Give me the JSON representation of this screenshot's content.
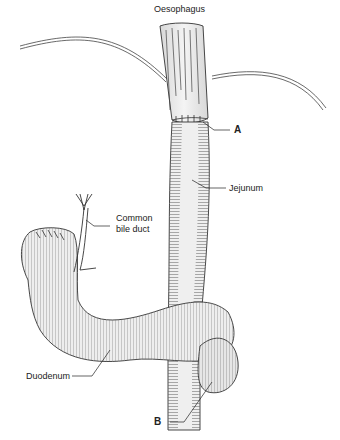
{
  "diagram": {
    "type": "anatomical illustration",
    "colors": {
      "tissue_fill": "#ececec",
      "outline": "#333333",
      "hatch": "#555555",
      "background": "#ffffff"
    },
    "labels": {
      "oesophagus": "Oesophagus",
      "a": "A",
      "jejunum": "Jejunum",
      "common_bile_duct_1": "Common",
      "common_bile_duct_2": "bile duct",
      "duodenum": "Duodenum",
      "b": "B"
    }
  }
}
